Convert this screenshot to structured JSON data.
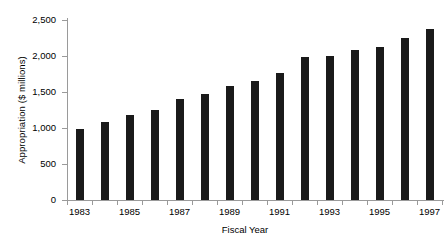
{
  "chart_data": {
    "type": "bar",
    "title": "",
    "xlabel": "Fiscal Year",
    "ylabel": "Appropriation ($ millions)",
    "categories": [
      "1983",
      "1984",
      "1985",
      "1986",
      "1987",
      "1988",
      "1989",
      "1990",
      "1991",
      "1992",
      "1993",
      "1994",
      "1995",
      "1996",
      "1997"
    ],
    "values": [
      985,
      1085,
      1180,
      1250,
      1400,
      1470,
      1580,
      1655,
      1765,
      1985,
      2000,
      2085,
      2125,
      2250,
      2375
    ],
    "series": [
      {
        "name": "Appropriation",
        "values": [
          985,
          1085,
          1180,
          1250,
          1400,
          1470,
          1580,
          1655,
          1765,
          1985,
          2000,
          2085,
          2125,
          2250,
          2375
        ]
      }
    ],
    "ylim": [
      0,
      2500
    ],
    "yticks": [
      0,
      500,
      1000,
      1500,
      2000,
      2500
    ],
    "ytick_labels": [
      "0",
      "500",
      "1,000",
      "1,500",
      "2,000",
      "2,500"
    ],
    "xtick_labels": [
      "1983",
      "1985",
      "1987",
      "1989",
      "1991",
      "1993",
      "1995",
      "1997"
    ],
    "xtick_categories": [
      "1983",
      "1985",
      "1987",
      "1989",
      "1991",
      "1993",
      "1995",
      "1997"
    ],
    "grid": false,
    "legend": false,
    "legend_position": "none",
    "bar_color": "#1a1a1a",
    "axis_color": "#9a9a9a",
    "background_color": "#ffffff"
  }
}
